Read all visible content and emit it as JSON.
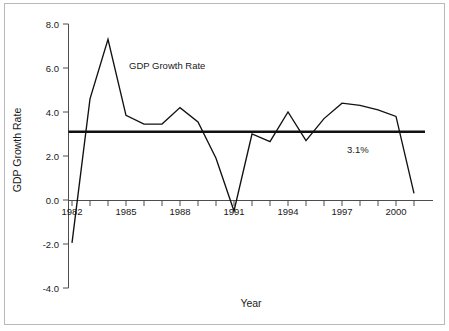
{
  "chart_data": {
    "type": "line",
    "title": "",
    "xlabel": "Year",
    "ylabel": "GDP Growth Rate",
    "xlim": [
      1981.6,
      2001.6
    ],
    "ylim": [
      -4.0,
      8.0
    ],
    "grid": false,
    "legend_position": "inline-annotation",
    "y_ticks": [
      "8.0",
      "6.0",
      "4.0",
      "2.0",
      "0.0",
      "-2.0",
      "-4.0"
    ],
    "y_tick_values": [
      8.0,
      6.0,
      4.0,
      2.0,
      0.0,
      -2.0,
      -4.0
    ],
    "x_ticks": [
      "1982",
      "1985",
      "1988",
      "1991",
      "1994",
      "1997",
      "2000"
    ],
    "x_tick_values": [
      1982,
      1985,
      1988,
      1991,
      1994,
      1997,
      2000
    ],
    "x_minor_tick_step": 1,
    "series": [
      {
        "name": "GDP Growth Rate",
        "color": "#111111",
        "x": [
          1982,
          1983,
          1984,
          1985,
          1986,
          1987,
          1988,
          1989,
          1990,
          1991,
          1992,
          1993,
          1994,
          1995,
          1996,
          1997,
          1998,
          1999,
          2000,
          2001
        ],
        "values": [
          -1.95,
          4.6,
          7.3,
          3.85,
          3.45,
          3.45,
          4.2,
          3.55,
          1.9,
          -0.5,
          3.0,
          2.65,
          4.0,
          2.7,
          3.7,
          4.4,
          4.3,
          4.1,
          3.8,
          0.3
        ]
      },
      {
        "name": "3.1% average reference",
        "color": "#111111",
        "type": "hline",
        "value": 3.1
      }
    ],
    "annotations": [
      {
        "text": "GDP Growth Rate",
        "x": 1985.1,
        "y": 5.95
      },
      {
        "text": "3.1%",
        "x": 1997.1,
        "y": 2.55
      }
    ]
  },
  "axes": {
    "y_axis_title": "GDP Growth Rate",
    "x_axis_title": "Year",
    "y_labels": [
      "8.0",
      "6.0",
      "4.0",
      "2.0",
      "0.0",
      "-2.0",
      "-4.0"
    ],
    "x_labels": [
      "1982",
      "1985",
      "1988",
      "1991",
      "1994",
      "1997",
      "2000"
    ]
  },
  "annotations": {
    "series_label": "GDP Growth Rate",
    "reference_label": "3.1%"
  }
}
